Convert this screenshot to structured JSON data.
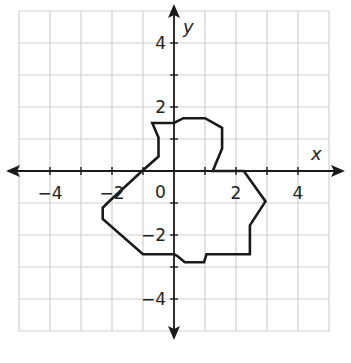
{
  "chart_data": {
    "type": "diagram",
    "title": "",
    "xlabel": "x",
    "ylabel": "y",
    "xlim": [
      -5,
      5
    ],
    "ylim": [
      -5,
      5
    ],
    "grid": true,
    "grid_step": 1,
    "x_tick_labels": [
      {
        "value": -4,
        "label": "−4"
      },
      {
        "value": -2,
        "label": "−2"
      },
      {
        "value": 2,
        "label": "2"
      },
      {
        "value": 4,
        "label": "4"
      }
    ],
    "y_tick_labels": [
      {
        "value": 4,
        "label": "4"
      },
      {
        "value": 2,
        "label": "2"
      },
      {
        "value": -2,
        "label": "−2"
      },
      {
        "value": -4,
        "label": "−4"
      }
    ],
    "origin_label": "0",
    "shape": {
      "name": "irregular-polygon-figure",
      "stroke": "#1a1a1a",
      "vertices": [
        [
          -0.7,
          1.5
        ],
        [
          0.0,
          1.5
        ],
        [
          0.3,
          1.65
        ],
        [
          1.0,
          1.65
        ],
        [
          1.55,
          1.35
        ],
        [
          1.55,
          0.7
        ],
        [
          1.25,
          0.0
        ],
        [
          2.25,
          0.0
        ],
        [
          2.95,
          -0.95
        ],
        [
          2.45,
          -1.7
        ],
        [
          2.45,
          -2.6
        ],
        [
          1.05,
          -2.6
        ],
        [
          0.97,
          -2.85
        ],
        [
          0.35,
          -2.85
        ],
        [
          0.1,
          -2.65
        ],
        [
          0.0,
          -2.6
        ],
        [
          -1.0,
          -2.6
        ],
        [
          -2.3,
          -1.5
        ],
        [
          -2.3,
          -1.15
        ],
        [
          -2.15,
          -1.0
        ],
        [
          -1.03,
          0.0
        ],
        [
          -0.5,
          0.45
        ],
        [
          -0.5,
          1.05
        ]
      ]
    }
  },
  "colors": {
    "grid": "#d0d0d0",
    "axis": "#1a1a1a",
    "shape": "#1a1a1a",
    "background": "#ffffff"
  }
}
